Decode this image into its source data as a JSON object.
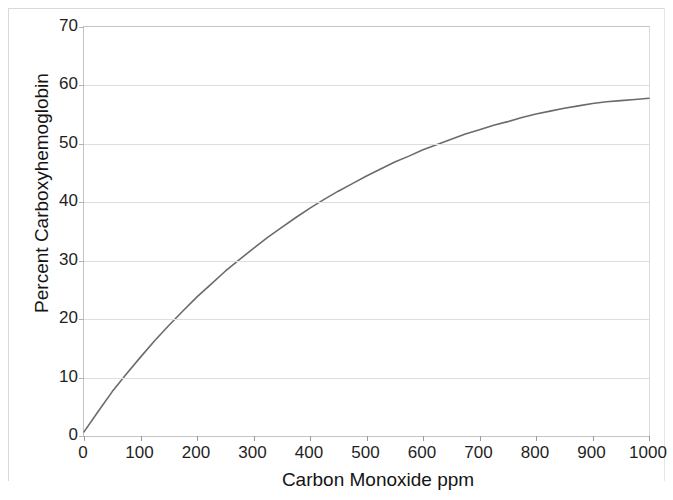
{
  "chart_data": {
    "type": "line",
    "title": "",
    "xlabel": "Carbon Monoxide ppm",
    "ylabel": "Percent  Carboxyhemoglobin",
    "xlim": [
      0,
      1000
    ],
    "ylim": [
      0,
      70
    ],
    "xticks": [
      0,
      100,
      200,
      300,
      400,
      500,
      600,
      700,
      800,
      900,
      1000
    ],
    "yticks": [
      0,
      10,
      20,
      30,
      40,
      50,
      60,
      70
    ],
    "grid": "horizontal",
    "legend": "none",
    "series": [
      {
        "name": "Percent Carboxyhemoglobin",
        "color": "#6b6b6b",
        "x": [
          0,
          25,
          50,
          75,
          100,
          125,
          150,
          175,
          200,
          225,
          250,
          275,
          300,
          325,
          350,
          375,
          400,
          425,
          450,
          475,
          500,
          525,
          550,
          575,
          600,
          625,
          650,
          675,
          700,
          725,
          750,
          775,
          800,
          825,
          850,
          875,
          900,
          925,
          950,
          975,
          1000
        ],
        "y": [
          0.7,
          4.2,
          7.6,
          10.6,
          13.5,
          16.3,
          18.9,
          21.4,
          23.8,
          26.0,
          28.2,
          30.2,
          32.1,
          34.0,
          35.7,
          37.4,
          39.0,
          40.5,
          41.9,
          43.2,
          44.5,
          45.7,
          46.9,
          47.9,
          49.0,
          49.9,
          50.8,
          51.7,
          52.4,
          53.2,
          53.8,
          54.5,
          55.1,
          55.6,
          56.1,
          56.5,
          56.9,
          57.2,
          57.4,
          57.6,
          57.8
        ]
      }
    ]
  },
  "axis": {
    "y_labels": [
      "70",
      "60",
      "50",
      "40",
      "30",
      "20",
      "10",
      "0"
    ],
    "x_labels": [
      "0",
      "100",
      "200",
      "300",
      "400",
      "500",
      "600",
      "700",
      "800",
      "900",
      "1000"
    ],
    "y_title": "Percent  Carboxyhemoglobin",
    "x_title": "Carbon Monoxide ppm"
  },
  "colors": {
    "line": "#6b6b6b",
    "grid": "#dedede",
    "frame": "#c4c4c4",
    "text": "#1f1f1f",
    "background": "#ffffff"
  }
}
